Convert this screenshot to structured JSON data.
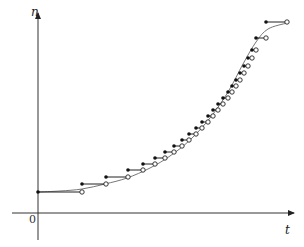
{
  "axes": {
    "y_label": "n",
    "x_label": "t",
    "origin_label": "0",
    "origin": [
      38,
      213
    ],
    "y_top": 13,
    "x_right": 294,
    "x_left": 12,
    "y_bottom": 240
  },
  "curve": {
    "description": "smooth logistic curve through step function",
    "points": [
      [
        38,
        192
      ],
      [
        60,
        191
      ],
      [
        82,
        189
      ],
      [
        105,
        184
      ],
      [
        127,
        178
      ],
      [
        150,
        168
      ],
      [
        170,
        156
      ],
      [
        190,
        140
      ],
      [
        210,
        118
      ],
      [
        228,
        92
      ],
      [
        243,
        64
      ],
      [
        256,
        42
      ],
      [
        268,
        29
      ],
      [
        287,
        23
      ]
    ]
  },
  "steps": [
    {
      "x1": 38,
      "x2": 82,
      "y": 192
    },
    {
      "x1": 82,
      "x2": 106,
      "y": 184
    },
    {
      "x1": 106,
      "x2": 128,
      "y": 177
    },
    {
      "x1": 128,
      "x2": 143,
      "y": 170
    },
    {
      "x1": 143,
      "x2": 155,
      "y": 164
    },
    {
      "x1": 155,
      "x2": 165,
      "y": 158
    },
    {
      "x1": 165,
      "x2": 174,
      "y": 152
    },
    {
      "x1": 174,
      "x2": 182,
      "y": 146
    },
    {
      "x1": 182,
      "x2": 189,
      "y": 140
    },
    {
      "x1": 189,
      "x2": 196,
      "y": 134
    },
    {
      "x1": 196,
      "x2": 202,
      "y": 128
    },
    {
      "x1": 202,
      "x2": 208,
      "y": 122
    },
    {
      "x1": 208,
      "x2": 213,
      "y": 116
    },
    {
      "x1": 213,
      "x2": 218,
      "y": 110
    },
    {
      "x1": 218,
      "x2": 223,
      "y": 104
    },
    {
      "x1": 223,
      "x2": 228,
      "y": 98
    },
    {
      "x1": 228,
      "x2": 232,
      "y": 92
    },
    {
      "x1": 232,
      "x2": 236,
      "y": 86
    },
    {
      "x1": 236,
      "x2": 240,
      "y": 80
    },
    {
      "x1": 240,
      "x2": 244,
      "y": 73
    },
    {
      "x1": 244,
      "x2": 248,
      "y": 66
    },
    {
      "x1": 248,
      "x2": 252,
      "y": 58
    },
    {
      "x1": 252,
      "x2": 256,
      "y": 50
    },
    {
      "x1": 256,
      "x2": 266,
      "y": 38
    },
    {
      "x1": 266,
      "x2": 287,
      "y": 22
    }
  ]
}
